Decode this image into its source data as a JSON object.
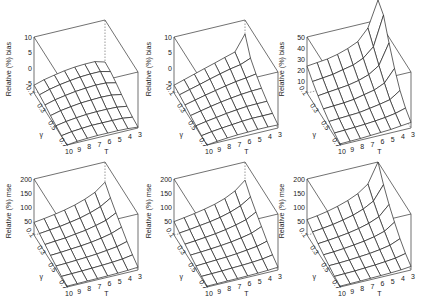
{
  "figure": {
    "layout": "2 rows x 3 columns of 3D wireframe surface plots"
  },
  "chart_data": [
    {
      "type": "surface3d",
      "panel": "row1-col1",
      "zlabel": "Relative (%) bias",
      "xlabel": "T",
      "ylabel": "γ",
      "x_ticks": [
        "10",
        "9",
        "8",
        "7",
        "6",
        "5",
        "4",
        "3"
      ],
      "y_ticks": [
        "0.1",
        "0.3",
        "0.5",
        "0.7"
      ],
      "z_ticks": [
        "-5",
        "0",
        "5",
        "10"
      ],
      "zlim": [
        -8,
        10
      ],
      "x": [
        10,
        9,
        8,
        7,
        6,
        5,
        4,
        3
      ],
      "y": [
        0.1,
        0.2,
        0.3,
        0.4,
        0.5,
        0.6,
        0.7
      ],
      "z": [
        [
          -5.5,
          -4.5,
          -3.8,
          -3.2,
          -2.8,
          -2.6,
          -2.6,
          -3.5
        ],
        [
          -5.8,
          -4.8,
          -4.1,
          -3.6,
          -3.2,
          -3.0,
          -3.0,
          -3.8
        ],
        [
          -6.3,
          -5.4,
          -4.8,
          -4.3,
          -4.0,
          -3.8,
          -3.9,
          -4.6
        ],
        [
          -6.9,
          -6.1,
          -5.6,
          -5.2,
          -5.0,
          -4.9,
          -5.0,
          -5.6
        ],
        [
          -7.4,
          -6.8,
          -6.4,
          -6.1,
          -6.0,
          -6.0,
          -6.1,
          -6.6
        ],
        [
          -7.8,
          -7.3,
          -7.0,
          -6.8,
          -6.8,
          -6.8,
          -6.9,
          -7.3
        ],
        [
          -8.0,
          -7.6,
          -7.4,
          -7.3,
          -7.3,
          -7.3,
          -7.4,
          -7.7
        ]
      ]
    },
    {
      "type": "surface3d",
      "panel": "row1-col2",
      "zlabel": "Relative (%) bias",
      "xlabel": "T",
      "ylabel": "γ",
      "x_ticks": [
        "10",
        "9",
        "8",
        "7",
        "6",
        "5",
        "4",
        "3"
      ],
      "y_ticks": [
        "0.1",
        "0.3",
        "0.5",
        "0.7"
      ],
      "z_ticks": [
        "-5",
        "0",
        "5",
        "10"
      ],
      "zlim": [
        -8,
        10
      ],
      "x": [
        10,
        9,
        8,
        7,
        6,
        5,
        4,
        3
      ],
      "y": [
        0.1,
        0.2,
        0.3,
        0.4,
        0.5,
        0.6,
        0.7
      ],
      "z": [
        [
          -5.5,
          -4.5,
          -3.5,
          -2.5,
          -1.5,
          -0.5,
          0.5,
          5.5
        ],
        [
          -5.8,
          -4.9,
          -4.0,
          -3.1,
          -2.2,
          -1.4,
          -0.8,
          0.5
        ],
        [
          -6.3,
          -5.5,
          -4.7,
          -4.0,
          -3.3,
          -2.7,
          -2.3,
          -1.8
        ],
        [
          -6.9,
          -6.2,
          -5.5,
          -4.9,
          -4.4,
          -4.0,
          -3.7,
          -3.6
        ],
        [
          -7.4,
          -6.8,
          -6.3,
          -5.8,
          -5.4,
          -5.1,
          -5.0,
          -5.0
        ],
        [
          -7.8,
          -7.3,
          -6.9,
          -6.6,
          -6.3,
          -6.1,
          -6.1,
          -6.1
        ],
        [
          -8.0,
          -7.6,
          -7.3,
          -7.1,
          -7.0,
          -6.9,
          -6.9,
          -7.0
        ]
      ]
    },
    {
      "type": "surface3d",
      "panel": "row1-col3",
      "zlabel": "Relative (%) bias",
      "xlabel": "T",
      "ylabel": "γ",
      "x_ticks": [
        "10",
        "9",
        "8",
        "7",
        "6",
        "5",
        "4",
        "3"
      ],
      "y_ticks": [
        "0.1",
        "0.3",
        "0.5",
        "0.7"
      ],
      "z_ticks": [
        "10",
        "20",
        "30",
        "40",
        "50"
      ],
      "zlim": [
        0,
        50
      ],
      "x": [
        10,
        9,
        8,
        7,
        6,
        5,
        4,
        3
      ],
      "y": [
        0.1,
        0.2,
        0.3,
        0.4,
        0.5,
        0.6,
        0.7
      ],
      "z": [
        [
          24,
          25,
          26,
          28,
          31,
          35,
          45,
          80
        ],
        [
          18,
          19,
          20,
          22,
          24,
          28,
          36,
          62
        ],
        [
          13,
          14,
          15,
          16,
          18,
          21,
          27,
          45
        ],
        [
          9,
          9.5,
          10,
          11,
          13,
          15,
          19,
          30
        ],
        [
          5.5,
          6,
          6.5,
          7,
          8.5,
          10,
          12,
          18
        ],
        [
          3,
          3.3,
          3.7,
          4.2,
          5,
          6,
          7.5,
          10
        ],
        [
          1,
          1.2,
          1.5,
          2,
          2.5,
          3,
          4,
          5
        ]
      ]
    },
    {
      "type": "surface3d",
      "panel": "row2-col1",
      "zlabel": "Relative (%) mse",
      "xlabel": "T",
      "ylabel": "γ",
      "x_ticks": [
        "10",
        "9",
        "8",
        "7",
        "6",
        "5",
        "4",
        "3"
      ],
      "y_ticks": [
        "0.1",
        "0.3",
        "0.5",
        "0.7"
      ],
      "z_ticks": [
        "50",
        "100",
        "150",
        "200"
      ],
      "zlim": [
        0,
        200
      ],
      "x": [
        10,
        9,
        8,
        7,
        6,
        5,
        4,
        3
      ],
      "y": [
        0.1,
        0.2,
        0.3,
        0.4,
        0.5,
        0.6,
        0.7
      ],
      "z": [
        [
          45,
          50,
          56,
          63,
          72,
          84,
          100,
          128
        ],
        [
          36,
          40,
          44,
          50,
          57,
          67,
          80,
          102
        ],
        [
          28,
          31,
          34,
          39,
          44,
          52,
          62,
          80
        ],
        [
          20,
          22,
          25,
          28,
          32,
          38,
          46,
          60
        ],
        [
          13,
          14,
          16,
          18,
          21,
          25,
          30,
          40
        ],
        [
          7,
          8,
          9,
          10,
          12,
          14,
          17,
          23
        ],
        [
          3,
          3.5,
          4,
          4.5,
          5,
          6,
          7.5,
          10
        ]
      ]
    },
    {
      "type": "surface3d",
      "panel": "row2-col2",
      "zlabel": "Relative (%) mse",
      "xlabel": "T",
      "ylabel": "γ",
      "x_ticks": [
        "10",
        "9",
        "8",
        "7",
        "6",
        "5",
        "4",
        "3"
      ],
      "y_ticks": [
        "0.1",
        "0.3",
        "0.5",
        "0.7"
      ],
      "z_ticks": [
        "50",
        "100",
        "150",
        "200"
      ],
      "zlim": [
        0,
        200
      ],
      "x": [
        10,
        9,
        8,
        7,
        6,
        5,
        4,
        3
      ],
      "y": [
        0.1,
        0.2,
        0.3,
        0.4,
        0.5,
        0.6,
        0.7
      ],
      "z": [
        [
          48,
          53,
          59,
          66,
          75,
          87,
          105,
          135
        ],
        [
          38,
          42,
          47,
          52,
          59,
          69,
          83,
          106
        ],
        [
          29,
          32,
          36,
          40,
          46,
          54,
          64,
          83
        ],
        [
          21,
          23,
          26,
          29,
          33,
          39,
          47,
          62
        ],
        [
          13,
          15,
          17,
          19,
          22,
          26,
          31,
          41
        ],
        [
          7,
          8,
          9,
          10.5,
          12,
          14,
          17,
          23
        ],
        [
          3,
          3.5,
          4,
          4.5,
          5,
          6,
          7.5,
          10
        ]
      ]
    },
    {
      "type": "surface3d",
      "panel": "row2-col3",
      "zlabel": "Relative (%) mse",
      "xlabel": "T",
      "ylabel": "γ",
      "x_ticks": [
        "10",
        "9",
        "8",
        "7",
        "6",
        "5",
        "4",
        "3"
      ],
      "y_ticks": [
        "0.1",
        "0.3",
        "0.5",
        "0.7"
      ],
      "z_ticks": [
        "50",
        "100",
        "150",
        "200"
      ],
      "zlim": [
        0,
        200
      ],
      "x": [
        10,
        9,
        8,
        7,
        6,
        5,
        4,
        3
      ],
      "y": [
        0.1,
        0.2,
        0.3,
        0.4,
        0.5,
        0.6,
        0.7
      ],
      "z": [
        [
          55,
          60,
          67,
          76,
          88,
          104,
          130,
          200
        ],
        [
          42,
          46,
          51,
          58,
          67,
          80,
          100,
          150
        ],
        [
          31,
          34,
          38,
          43,
          50,
          60,
          75,
          110
        ],
        [
          22,
          24,
          27,
          31,
          36,
          43,
          54,
          78
        ],
        [
          14,
          15,
          17,
          20,
          23,
          28,
          35,
          50
        ],
        [
          7,
          8,
          9,
          11,
          13,
          16,
          20,
          28
        ],
        [
          3,
          3.5,
          4,
          5,
          6,
          7,
          9,
          13
        ]
      ]
    }
  ],
  "panels": [
    {
      "zlabel": "Relative (%) bias",
      "xlabel": "T",
      "ylabel": "γ"
    },
    {
      "zlabel": "Relative (%) bias",
      "xlabel": "T",
      "ylabel": "γ"
    },
    {
      "zlabel": "Relative (%) bias",
      "xlabel": "T",
      "ylabel": "γ"
    },
    {
      "zlabel": "Relative (%) mse",
      "xlabel": "T",
      "ylabel": "γ"
    },
    {
      "zlabel": "Relative (%) mse",
      "xlabel": "T",
      "ylabel": "γ"
    },
    {
      "zlabel": "Relative (%) mse",
      "xlabel": "T",
      "ylabel": "γ"
    }
  ]
}
